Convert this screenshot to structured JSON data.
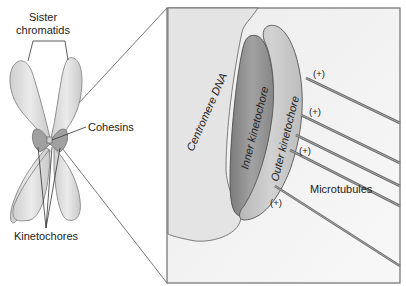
{
  "labels": {
    "sister_chromatids_line1": "Sister",
    "sister_chromatids_line2": "chromatids",
    "cohesins": "Cohesins",
    "kinetochores": "Kinetochores",
    "centromere_dna": "Centromere DNA",
    "inner_kinetochore": "Inner kinetochore",
    "outer_kinetochore": "Outer kinetochore",
    "microtubules": "Microtubules",
    "plus_end": "(+)"
  },
  "colors": {
    "chromatid_fill": "#dcdcdc",
    "chromatid_stroke": "#7a7a7a",
    "centromere_fill": "#9c9c9c",
    "box_fill": "#f4f4f4",
    "box_stroke": "#6e6e6e",
    "centromere_dna_fill": "#e2e2e2",
    "inner_kinetochore_fill": "#8c8c8c",
    "outer_kinetochore_fill": "#c4c4c4",
    "microtubule": "#7a7a7a"
  }
}
